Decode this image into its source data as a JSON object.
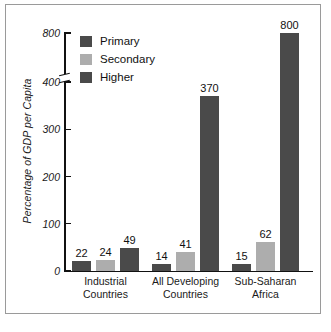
{
  "chart_data": {
    "type": "bar",
    "title": "",
    "subtitle": "",
    "xlabel": "",
    "ylabel": "Percentage of GDP per Capita",
    "categories": [
      "Industrial Countries",
      "All Developing Countries",
      "Sub-Saharan Africa"
    ],
    "category_lines": [
      [
        "Industrial",
        "Countries"
      ],
      [
        "All Developing",
        "Countries"
      ],
      [
        "Sub-Saharan",
        "Africa"
      ]
    ],
    "series": [
      {
        "name": "Primary",
        "color": "#4a4a4a",
        "values": [
          22,
          24,
          15
        ]
      },
      {
        "name": "Secondary",
        "color": "#adadad",
        "values": [
          24,
          41,
          62
        ]
      },
      {
        "name": "Higher",
        "color": "#4a4a4a",
        "values": [
          49,
          370,
          800
        ]
      }
    ],
    "bar_labels": [
      [
        "22",
        "24",
        "49"
      ],
      [
        "14",
        "41",
        "370"
      ],
      [
        "15",
        "62",
        "800"
      ]
    ],
    "group_values": [
      [
        22,
        24,
        49
      ],
      [
        14,
        41,
        370
      ],
      [
        15,
        62,
        800
      ]
    ],
    "ylim": [
      0,
      800
    ],
    "yticks": [
      0,
      100,
      200,
      300,
      400,
      800
    ],
    "ytick_labels": [
      "0",
      "100",
      "200",
      "300",
      "400",
      "800"
    ],
    "axis_break": {
      "present": true,
      "between": [
        400,
        800
      ]
    },
    "grid": false,
    "legend": {
      "position": "top-left-inside",
      "entries": [
        {
          "label": "Primary",
          "color": "#4a4a4a"
        },
        {
          "label": "Secondary",
          "color": "#adadad"
        },
        {
          "label": "Higher",
          "color": "#4a4a4a"
        }
      ]
    }
  },
  "axis": {
    "y_title": "Percentage of GDP per Capita",
    "tick_0": "0",
    "tick_100": "100",
    "tick_200": "200",
    "tick_300": "300",
    "tick_400": "400",
    "tick_800": "800"
  },
  "legend": {
    "primary": "Primary",
    "secondary": "Secondary",
    "higher": "Higher"
  },
  "groups": [
    {
      "line1": "Industrial",
      "line2": "Countries",
      "labels": {
        "primary": "22",
        "secondary": "24",
        "higher": "49"
      }
    },
    {
      "line1": "All Developing",
      "line2": "Countries",
      "labels": {
        "primary": "14",
        "secondary": "41",
        "higher": "370"
      }
    },
    {
      "line1": "Sub-Saharan",
      "line2": "Africa",
      "labels": {
        "primary": "15",
        "secondary": "62",
        "higher": "800"
      }
    }
  ]
}
